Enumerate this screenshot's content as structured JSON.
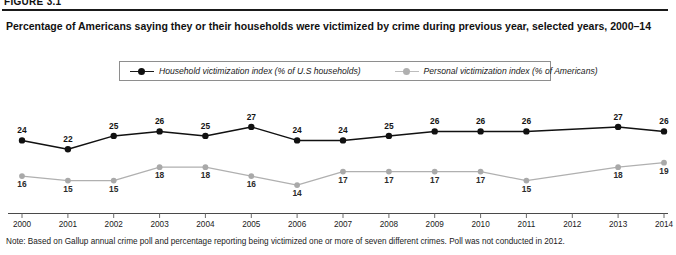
{
  "figure_number": "FIGURE 3.1",
  "title": "Percentage of Americans saying they or their households were victimized by crime during previous year, selected years, 2000–14",
  "note": "Note: Based on Gallup annual crime poll and percentage reporting being victimized one or more of seven different crimes. Poll was not conducted in 2012.",
  "legend": {
    "household": {
      "label": "Household victimization index (% of U.S households)",
      "marker": "filled-circle",
      "color": "#111111"
    },
    "personal": {
      "label": "Personal victimization index (% of Americans)",
      "marker": "filled-circle",
      "color": "#b0b0b0"
    }
  },
  "chart_data": {
    "type": "line",
    "title": "Percentage of Americans saying they or their households were victimized by crime during previous year, selected years, 2000–14",
    "xlabel": "",
    "ylabel": "",
    "grid": false,
    "legend_position": "top-center",
    "ylim": [
      12,
      29
    ],
    "categories": [
      "2000",
      "2001",
      "2002",
      "2003",
      "2004",
      "2005",
      "2006",
      "2007",
      "2008",
      "2009",
      "2010",
      "2011",
      "2012",
      "2013",
      "2014"
    ],
    "series": [
      {
        "name": "Household victimization index (% of U.S households)",
        "color": "#111111",
        "values": [
          24,
          22,
          25,
          26,
          25,
          27,
          24,
          24,
          25,
          26,
          26,
          26,
          null,
          27,
          26
        ]
      },
      {
        "name": "Personal victimization index (% of Americans)",
        "color": "#b0b0b0",
        "values": [
          16,
          15,
          15,
          18,
          18,
          16,
          14,
          17,
          17,
          17,
          17,
          15,
          null,
          18,
          19
        ]
      }
    ],
    "annotations": [
      "Poll was not conducted in 2012"
    ]
  }
}
